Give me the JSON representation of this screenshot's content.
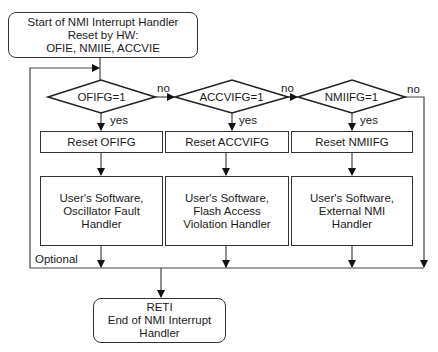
{
  "start": {
    "line1": "Start of NMI Interrupt Handler",
    "line2": "Reset by HW:",
    "line3": "OFIE, NMIIE, ACCVIE"
  },
  "decisions": [
    {
      "label": "OFIFG=1",
      "yes": "yes",
      "no": "no"
    },
    {
      "label": "ACCVIFG=1",
      "yes": "yes",
      "no": "no"
    },
    {
      "label": "NMIIFG=1",
      "yes": "yes",
      "no": "no"
    }
  ],
  "resets": [
    {
      "label": "Reset OFIFG"
    },
    {
      "label": "Reset ACCVIFG"
    },
    {
      "label": "Reset NMIIFG"
    }
  ],
  "handlers": [
    {
      "line1": "User's Software,",
      "line2": "Oscillator Fault",
      "line3": "Handler"
    },
    {
      "line1": "User's Software,",
      "line2": "Flash Access",
      "line3": "Violation Handler"
    },
    {
      "line1": "User's Software,",
      "line2": "External NMI",
      "line3": "Handler"
    }
  ],
  "optional_label": "Optional",
  "end": {
    "line1": "RETI",
    "line2": "End of NMI Interrupt",
    "line3": "Handler"
  }
}
